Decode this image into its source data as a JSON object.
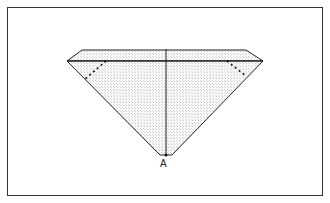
{
  "diagram": {
    "type": "gemstone cross-section",
    "labels": [
      {
        "id": "culet-label",
        "text": "A"
      }
    ],
    "colors": {
      "outline": "#222222",
      "stipple": "#555555",
      "background": "#ffffff",
      "frame": "#333333"
    }
  }
}
